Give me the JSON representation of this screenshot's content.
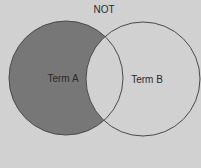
{
  "diagram": {
    "type": "venn",
    "title": "NOT",
    "operation": "A NOT B",
    "colors": {
      "background": "#d1d1d1",
      "highlight_fill": "#777777",
      "stroke": "#444444",
      "text": "#2a2a2a"
    },
    "sets": [
      {
        "id": "A",
        "label": "Term A",
        "highlighted": true
      },
      {
        "id": "B",
        "label": "Term B",
        "highlighted": false
      }
    ]
  }
}
